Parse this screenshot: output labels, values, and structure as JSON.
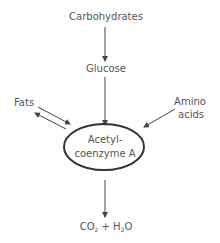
{
  "diagram": {
    "nodes": {
      "carbohydrates": "Carbohydrates",
      "glucose": "Glucose",
      "fats": "Fats",
      "amino_line1": "Amino",
      "amino_line2": "acids",
      "center_line1": "Acetyl-",
      "center_line2": "coenzyme A",
      "product_co": "CO",
      "product_co_sub": "2",
      "product_plus": " + H",
      "product_h_sub": "2",
      "product_o": "O"
    },
    "edges": [
      {
        "from": "Carbohydrates",
        "to": "Glucose"
      },
      {
        "from": "Glucose",
        "to": "Acetyl-coenzyme A"
      },
      {
        "from": "Fats",
        "to": "Acetyl-coenzyme A"
      },
      {
        "from": "Acetyl-coenzyme A",
        "to": "Fats"
      },
      {
        "from": "Amino acids",
        "to": "Acetyl-coenzyme A"
      },
      {
        "from": "Acetyl-coenzyme A",
        "to": "CO2 + H2O"
      }
    ],
    "colors": {
      "line": "#444444",
      "text": "#555555"
    }
  }
}
